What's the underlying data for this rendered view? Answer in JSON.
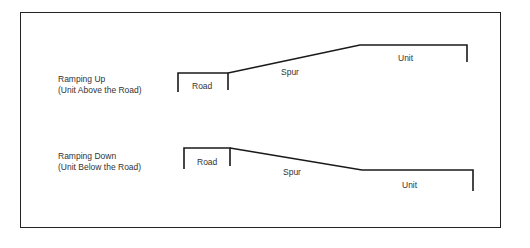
{
  "diagram": {
    "ramping_up": {
      "title": "Ramping Up",
      "subtitle": "(Unit Above the Road)",
      "road_label": "Road",
      "spur_label": "Spur",
      "unit_label": "Unit"
    },
    "ramping_down": {
      "title": "Ramping Down",
      "subtitle": "(Unit Below the Road)",
      "road_label": "Road",
      "spur_label": "Spur",
      "unit_label": "Unit"
    },
    "colors": {
      "line": "#1a1a1a",
      "text": "#333333",
      "background": "#ffffff"
    }
  }
}
